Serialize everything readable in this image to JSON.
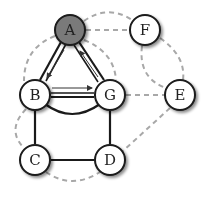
{
  "colors": {
    "node_fill": "#ffffff",
    "node_fill_highlight": "#7a7a7a",
    "node_stroke": "#1a1a1a",
    "solid_edge": "#1a1a1a",
    "dashed_edge": "#a8a8a8",
    "arrow": "#333333"
  },
  "nodes": [
    {
      "id": "A",
      "label": "A",
      "x": 70,
      "y": 30,
      "highlight": true
    },
    {
      "id": "F",
      "label": "F",
      "x": 145,
      "y": 30,
      "highlight": false
    },
    {
      "id": "B",
      "label": "B",
      "x": 35,
      "y": 95,
      "highlight": false
    },
    {
      "id": "G",
      "label": "G",
      "x": 110,
      "y": 95,
      "highlight": false
    },
    {
      "id": "E",
      "label": "E",
      "x": 180,
      "y": 95,
      "highlight": false
    },
    {
      "id": "C",
      "label": "C",
      "x": 35,
      "y": 160,
      "highlight": false
    },
    {
      "id": "D",
      "label": "D",
      "x": 110,
      "y": 160,
      "highlight": false
    }
  ],
  "edges": {
    "solid": [
      {
        "from": "A",
        "to": "B",
        "style": "double"
      },
      {
        "from": "A",
        "to": "G",
        "style": "double"
      },
      {
        "from": "B",
        "to": "G",
        "style": "double"
      },
      {
        "from": "B",
        "to": "G",
        "style": "curved-below"
      },
      {
        "from": "B",
        "to": "C",
        "style": "single"
      },
      {
        "from": "G",
        "to": "D",
        "style": "single"
      },
      {
        "from": "C",
        "to": "D",
        "style": "single"
      }
    ],
    "arrows": [
      {
        "from": "A",
        "to": "B"
      },
      {
        "from": "G",
        "to": "A"
      },
      {
        "from": "B",
        "to": "G"
      }
    ],
    "dashed": [
      {
        "from": "A",
        "to": "F",
        "style": "straight"
      },
      {
        "from": "A",
        "to": "F",
        "style": "arc-above"
      },
      {
        "from": "A",
        "to": "B",
        "style": "arc-left"
      },
      {
        "from": "A",
        "to": "G",
        "style": "arc-right"
      },
      {
        "from": "F",
        "to": "E",
        "style": "arc-right"
      },
      {
        "from": "F",
        "to": "E",
        "style": "arc-left"
      },
      {
        "from": "G",
        "to": "E",
        "style": "straight"
      },
      {
        "from": "E",
        "to": "D",
        "style": "straight"
      },
      {
        "from": "B",
        "to": "C",
        "style": "arc-left"
      },
      {
        "from": "C",
        "to": "D",
        "style": "arc-below"
      }
    ]
  }
}
